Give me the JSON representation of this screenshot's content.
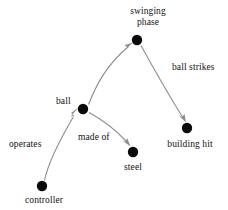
{
  "diagram": {
    "type": "node-link-graph",
    "background_color": "#ffffff",
    "node_color": "#0a0a0a",
    "edge_color": "#8d8d8d",
    "nodes": [
      {
        "id": "swinging_phase",
        "label": "swinging\nphase",
        "label_line1": "swinging",
        "label_line2": "phase",
        "x": 137,
        "y": 40,
        "r": 5.2,
        "label_x": 148,
        "label_y": 7
      },
      {
        "id": "ball",
        "label": "ball",
        "x": 83,
        "y": 109,
        "r": 5.2,
        "label_x": 65,
        "label_y": 96
      },
      {
        "id": "steel",
        "label": "steel",
        "x": 133,
        "y": 152,
        "r": 5.2,
        "label_x": 133,
        "label_y": 162
      },
      {
        "id": "building_hit",
        "label": "building hit",
        "x": 187,
        "y": 128,
        "r": 5.2,
        "label_x": 190,
        "label_y": 139
      },
      {
        "id": "controller",
        "label": "controller",
        "x": 42,
        "y": 186,
        "r": 5.2,
        "label_x": 44,
        "label_y": 195
      }
    ],
    "edges": [
      {
        "id": "ball_to_swinging",
        "from": "ball",
        "to": "swinging_phase",
        "label": "",
        "arrow": true
      },
      {
        "id": "swinging_to_building",
        "from": "swinging_phase",
        "to": "building_hit",
        "label": "ball strikes",
        "label_x": 172,
        "label_y": 62,
        "arrow": true
      },
      {
        "id": "ball_to_steel",
        "from": "ball",
        "to": "steel",
        "label": "made of",
        "label_x": 78,
        "label_y": 132,
        "arrow": true
      },
      {
        "id": "controller_to_ball",
        "from": "controller",
        "to": "ball",
        "label": "operates",
        "label_x": 9,
        "label_y": 139,
        "arrow": true
      }
    ]
  }
}
